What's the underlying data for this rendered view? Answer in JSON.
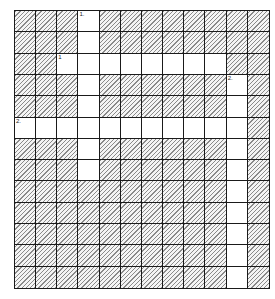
{
  "puzzle": {
    "type": "crossword-grid",
    "columns": 12,
    "rows": 13,
    "colors": {
      "open_cell": "#ffffff",
      "blocked_cell_hatch": "#8a8a8a",
      "grid_line": "#1a1a1a"
    },
    "open_cells": [
      [
        0,
        3
      ],
      [
        1,
        3
      ],
      [
        2,
        2
      ],
      [
        2,
        3
      ],
      [
        2,
        4
      ],
      [
        2,
        5
      ],
      [
        2,
        6
      ],
      [
        2,
        7
      ],
      [
        2,
        8
      ],
      [
        2,
        9
      ],
      [
        3,
        3
      ],
      [
        3,
        10
      ],
      [
        4,
        3
      ],
      [
        4,
        10
      ],
      [
        5,
        0
      ],
      [
        5,
        1
      ],
      [
        5,
        2
      ],
      [
        5,
        3
      ],
      [
        5,
        4
      ],
      [
        5,
        5
      ],
      [
        5,
        6
      ],
      [
        5,
        7
      ],
      [
        5,
        8
      ],
      [
        5,
        9
      ],
      [
        5,
        10
      ],
      [
        6,
        3
      ],
      [
        6,
        10
      ],
      [
        7,
        3
      ],
      [
        7,
        10
      ],
      [
        8,
        10
      ],
      [
        9,
        10
      ],
      [
        10,
        10
      ],
      [
        11,
        10
      ],
      [
        12,
        10
      ]
    ],
    "clue_numbers": [
      {
        "row": 0,
        "col": 3,
        "label": "1.",
        "direction": "down"
      },
      {
        "row": 2,
        "col": 2,
        "label": "1",
        "direction": "across"
      },
      {
        "row": 3,
        "col": 10,
        "label": "2.",
        "direction": "down"
      },
      {
        "row": 5,
        "col": 0,
        "label": "2.",
        "direction": "across"
      }
    ]
  }
}
